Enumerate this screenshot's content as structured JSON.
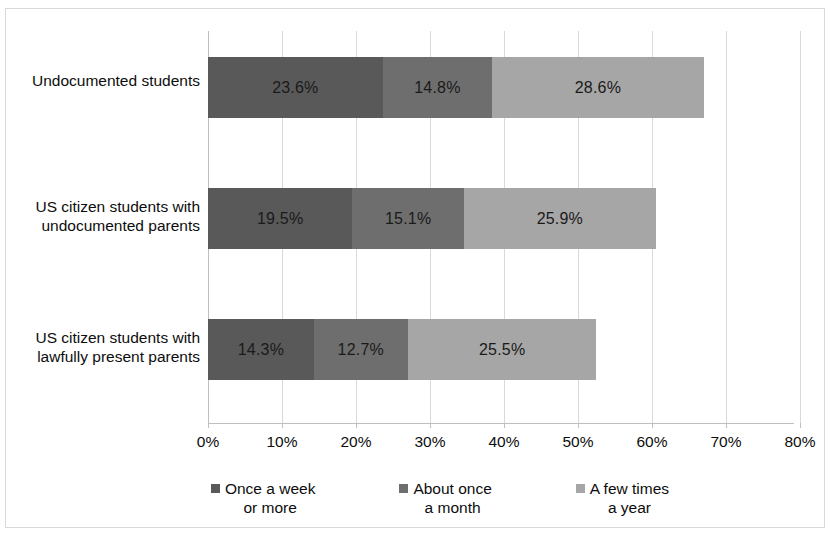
{
  "chart_data": {
    "type": "bar",
    "orientation": "horizontal",
    "stacked": true,
    "title": "",
    "subtitle": "",
    "xlabel": "",
    "ylabel": "",
    "xlim": [
      0,
      80
    ],
    "xtick_step": 10,
    "xtick_labels": [
      "0%",
      "10%",
      "20%",
      "30%",
      "40%",
      "50%",
      "60%",
      "70%",
      "80%"
    ],
    "grid": true,
    "grid_axis": "x",
    "legend_position": "bottom",
    "value_label_suffix": "%",
    "categories": [
      "Undocumented\nstudents",
      "US citizen students\nwith undocumented\nparents",
      "US citizen students\nwith lawfully present\nparents"
    ],
    "series": [
      {
        "name": "Once a week\nor more",
        "color": "#595959",
        "values": [
          23.6,
          19.5,
          14.3
        ],
        "labels": [
          "23.6%",
          "19.5%",
          "14.3%"
        ]
      },
      {
        "name": "About once\na month",
        "color": "#6e6e6e",
        "values": [
          14.8,
          15.1,
          12.7
        ],
        "labels": [
          "14.8%",
          "15.1%",
          "12.7%"
        ]
      },
      {
        "name": "A few times\na year",
        "color": "#a6a6a6",
        "values": [
          28.6,
          25.9,
          25.5
        ],
        "labels": [
          "28.6%",
          "25.9%",
          "25.5%"
        ]
      }
    ],
    "totals": [
      67.0,
      60.5,
      52.5
    ]
  },
  "colors": {
    "series_1": "#595959",
    "series_2": "#6e6e6e",
    "series_3": "#a6a6a6",
    "gridline": "#d9d9d9",
    "axis": "#bfbfbf",
    "text": "#0d0d0d",
    "background": "#ffffff",
    "border": "#d9d9d9"
  }
}
